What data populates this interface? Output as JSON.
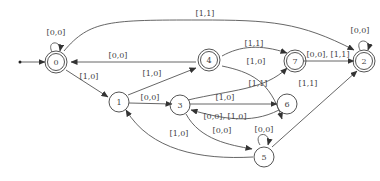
{
  "diagram": {
    "type": "state-machine",
    "nodes": [
      {
        "id": "0",
        "label": "0",
        "accepting": true,
        "initial": true
      },
      {
        "id": "1",
        "label": "1",
        "accepting": false
      },
      {
        "id": "2",
        "label": "2",
        "accepting": true
      },
      {
        "id": "3",
        "label": "3",
        "accepting": false
      },
      {
        "id": "4",
        "label": "4",
        "accepting": true
      },
      {
        "id": "5",
        "label": "5",
        "accepting": false
      },
      {
        "id": "6",
        "label": "6",
        "accepting": false
      },
      {
        "id": "7",
        "label": "7",
        "accepting": true
      }
    ],
    "edges": [
      {
        "from": "0",
        "to": "0",
        "label": "[0,0]"
      },
      {
        "from": "0",
        "to": "2",
        "label": "[1,1]"
      },
      {
        "from": "4",
        "to": "0",
        "label": "[0,0]"
      },
      {
        "from": "0",
        "to": "1",
        "label": "[1,0]"
      },
      {
        "from": "1",
        "to": "4",
        "label": "[1,0]"
      },
      {
        "from": "4",
        "to": "7",
        "label": "[1,1]"
      },
      {
        "from": "4",
        "to": "6",
        "label": "[1,0]"
      },
      {
        "from": "7",
        "to": "2",
        "label": "[0,0], [1,1]"
      },
      {
        "from": "2",
        "to": "2",
        "label": "[0,0]"
      },
      {
        "from": "1",
        "to": "3",
        "label": "[0,0]"
      },
      {
        "from": "3",
        "to": "7",
        "label": "[1,1]"
      },
      {
        "from": "3",
        "to": "6",
        "label": "[1,0]"
      },
      {
        "from": "6",
        "to": "3",
        "label": "[0,0], [1,0]"
      },
      {
        "from": "3",
        "to": "5",
        "label": "[0,0]"
      },
      {
        "from": "5",
        "to": "1",
        "label": "[1,0]"
      },
      {
        "from": "5",
        "to": "5",
        "label": "[0,0]"
      },
      {
        "from": "5",
        "to": "2",
        "label": "[1,1]"
      }
    ]
  }
}
